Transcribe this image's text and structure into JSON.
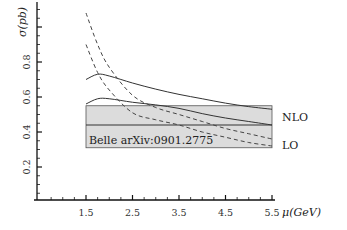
{
  "chart_data": {
    "type": "line",
    "title": "",
    "xlabel": "μ(GeV)",
    "ylabel": "σ(pb)",
    "xlim": [
      0.5,
      5.8
    ],
    "ylim": [
      0,
      1.15
    ],
    "x_ticks": [
      "1.5",
      "2.5",
      "3.5",
      "4.5",
      "5.5"
    ],
    "y_ticks": [
      "0.2",
      "0.4",
      "0.6",
      "0.8"
    ],
    "grid": false,
    "legend_position": "right (curve-end labels)",
    "band": {
      "label": "Belle arXiv:0901.2775",
      "x_range": [
        1.5,
        5.5
      ],
      "y_range": [
        0.31,
        0.55
      ],
      "central": 0.44,
      "color": "#dcdcdc"
    },
    "series": [
      {
        "name": "NLO (upper)",
        "style": "solid",
        "x": [
          1.5,
          1.75,
          2.0,
          2.5,
          3.0,
          3.5,
          4.0,
          4.5,
          5.0,
          5.5
        ],
        "y": [
          0.7,
          0.73,
          0.72,
          0.68,
          0.645,
          0.615,
          0.59,
          0.565,
          0.545,
          0.53
        ]
      },
      {
        "name": "NLO (lower)",
        "style": "solid",
        "x": [
          1.5,
          1.75,
          2.0,
          2.5,
          3.0,
          3.5,
          4.0,
          4.5,
          5.0,
          5.5
        ],
        "y": [
          0.56,
          0.59,
          0.59,
          0.57,
          0.555,
          0.535,
          0.505,
          0.48,
          0.46,
          0.44
        ]
      },
      {
        "name": "LO (upper)",
        "style": "dashed",
        "x": [
          1.5,
          1.75,
          2.0,
          2.5,
          3.0,
          3.5,
          4.0,
          4.5,
          5.0,
          5.5
        ],
        "y": [
          1.08,
          0.9,
          0.77,
          0.61,
          0.54,
          0.5,
          0.46,
          0.42,
          0.39,
          0.36
        ]
      },
      {
        "name": "LO (lower)",
        "style": "dashed",
        "x": [
          1.5,
          1.75,
          2.0,
          2.5,
          3.0,
          3.5,
          4.0,
          4.5,
          5.0,
          5.5
        ],
        "y": [
          0.9,
          0.74,
          0.64,
          0.51,
          0.47,
          0.44,
          0.4,
          0.37,
          0.34,
          0.32
        ]
      }
    ],
    "annotations": [
      {
        "text": "NLO",
        "x": 5.65,
        "y": 0.48
      },
      {
        "text": "LO",
        "x": 5.65,
        "y": 0.33
      }
    ]
  },
  "labels": {
    "ylabel": "σ(pb)",
    "xlabel": "μ(GeV)",
    "band_label": "Belle arXiv:0901.2775",
    "nlo": "NLO",
    "lo": "LO",
    "xticks": [
      "1.5",
      "2.5",
      "3.5",
      "4.5",
      "5.5"
    ],
    "yticks": [
      "0.2",
      "0.4",
      "0.6",
      "0.8"
    ]
  }
}
